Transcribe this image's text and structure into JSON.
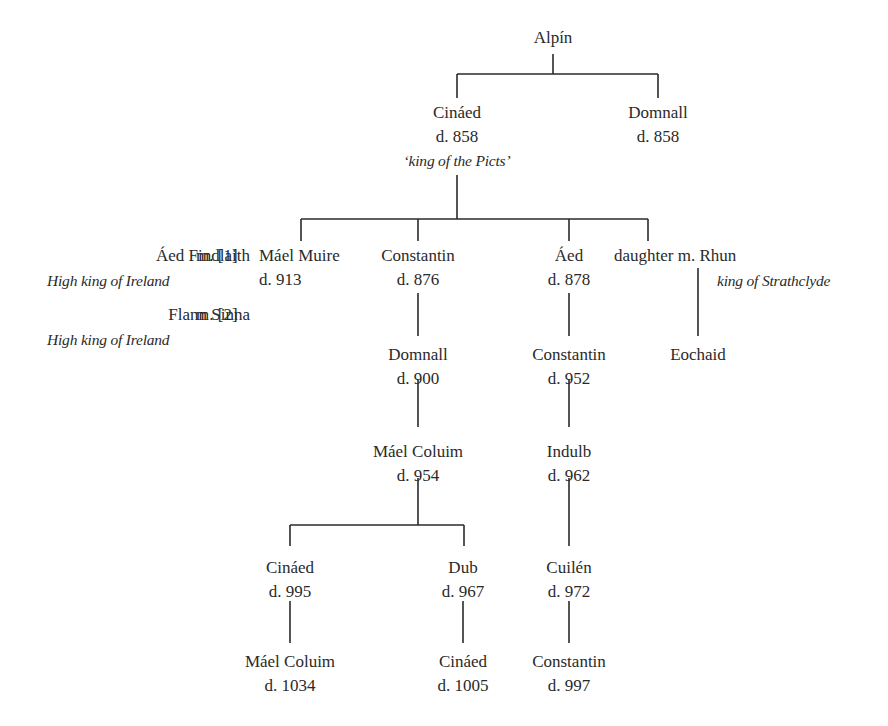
{
  "tree": {
    "root": {
      "name": "Alpín"
    },
    "gen1": [
      {
        "name": "Cináed",
        "death": "d. 858",
        "title": "‘king of the Picts’"
      },
      {
        "name": "Domnall",
        "death": "d. 858"
      }
    ],
    "spouses": [
      {
        "name": "Áed Findlaith",
        "marriage": "m. [1]",
        "title": "High king of Ireland"
      },
      {
        "name": "Flann Sinna",
        "marriage": "m. [2]",
        "title": "High king of Ireland"
      }
    ],
    "gen2": [
      {
        "name": "Máel Muire",
        "death": "d. 913"
      },
      {
        "name": "Constantin",
        "death": "d. 876"
      },
      {
        "name": "Áed",
        "death": "d. 878"
      },
      {
        "name": "daughter m. Rhun",
        "title": "king of Strathclyde"
      }
    ],
    "gen3": [
      {
        "name": "Domnall",
        "death": "d. 900"
      },
      {
        "name": "Constantin",
        "death": "d. 952"
      },
      {
        "name": "Eochaid"
      }
    ],
    "gen4": [
      {
        "name": "Máel Coluim",
        "death": "d. 954"
      },
      {
        "name": "Indulb",
        "death": "d. 962"
      }
    ],
    "gen5": [
      {
        "name": "Cináed",
        "death": "d. 995"
      },
      {
        "name": "Dub",
        "death": "d. 967"
      },
      {
        "name": "Cuilén",
        "death": "d. 972"
      }
    ],
    "gen6": [
      {
        "name": "Máel Coluim",
        "death": "d. 1034"
      },
      {
        "name": "Cináed",
        "death": "d. 1005"
      },
      {
        "name": "Constantin",
        "death": "d. 997"
      }
    ]
  }
}
